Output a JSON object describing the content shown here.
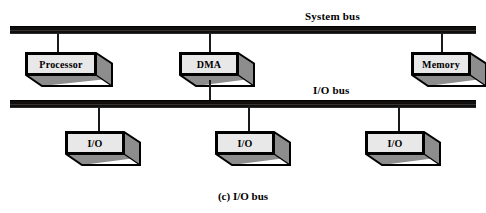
{
  "figure": {
    "caption": "(c) I/O bus",
    "background_color": "#ffffff",
    "bus_color": "#100f0d",
    "box_face_color": "#e8e8e8",
    "box_shade_color": "#8d8d8d",
    "outline_color": "#000000"
  },
  "buses": [
    {
      "id": "system-bus",
      "label": "System bus"
    },
    {
      "id": "io-bus",
      "label": "I/O bus"
    }
  ],
  "system_bus_nodes": [
    {
      "label": "Processor"
    },
    {
      "label": "DMA"
    },
    {
      "label": "Memory"
    }
  ],
  "io_bus_nodes": [
    {
      "label": "I/O"
    },
    {
      "label": "I/O"
    },
    {
      "label": "I/O"
    }
  ],
  "diagram_data": {
    "type": "block-diagram",
    "title": "(c) I/O bus",
    "topology": "two parallel horizontal buses; DMA bridges both",
    "buses": [
      "System bus",
      "I/O bus"
    ],
    "connections": [
      {
        "from": "Processor",
        "to": "System bus"
      },
      {
        "from": "DMA",
        "to": "System bus"
      },
      {
        "from": "Memory",
        "to": "System bus"
      },
      {
        "from": "DMA",
        "to": "I/O bus"
      },
      {
        "from": "I/O",
        "to": "I/O bus"
      },
      {
        "from": "I/O",
        "to": "I/O bus"
      },
      {
        "from": "I/O",
        "to": "I/O bus"
      }
    ]
  }
}
